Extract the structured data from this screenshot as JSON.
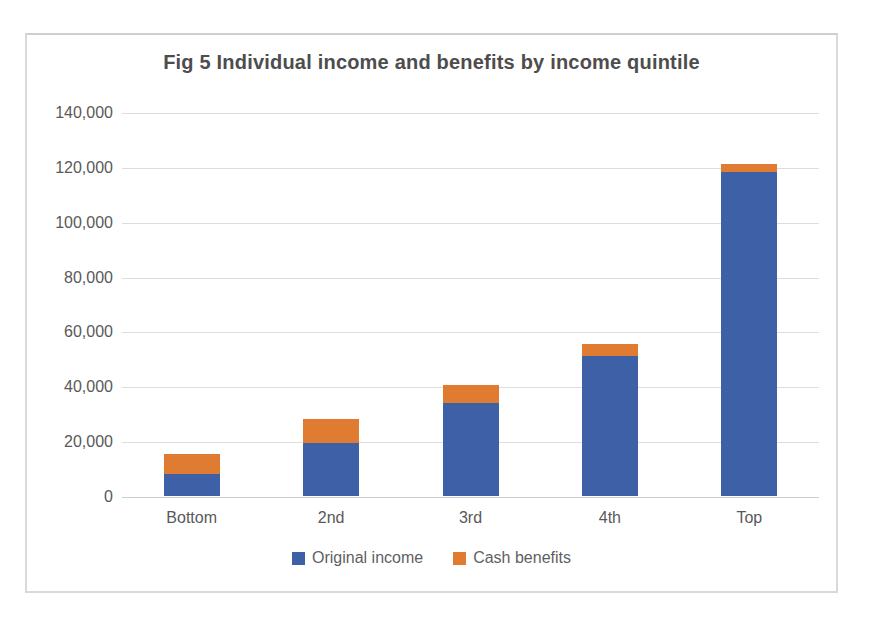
{
  "chart_data": {
    "type": "bar",
    "stacked": true,
    "title": "Fig 5 Individual income and benefits by income quintile",
    "categories": [
      "Bottom",
      "2nd",
      "3rd",
      "4th",
      "Top"
    ],
    "series": [
      {
        "name": "Original income",
        "color": "#3d60a6",
        "values": [
          8000,
          19500,
          34000,
          51000,
          118000
        ]
      },
      {
        "name": "Cash benefits",
        "color": "#e07c31",
        "values": [
          7500,
          8500,
          6500,
          4500,
          3000
        ]
      }
    ],
    "xlabel": "",
    "ylabel": "",
    "ylim": [
      0,
      140000
    ],
    "ytick_step": 20000,
    "ytick_labels": [
      "0",
      "20,000",
      "40,000",
      "60,000",
      "80,000",
      "100,000",
      "120,000",
      "140,000"
    ],
    "grid": true,
    "legend_position": "bottom"
  },
  "colors": {
    "grid": "#dddddd",
    "baseline": "#c9cdd4",
    "axis_text": "#595959",
    "title_text": "#4d4d4d",
    "frame_border": "#d9d9d9",
    "background": "#ffffff"
  }
}
